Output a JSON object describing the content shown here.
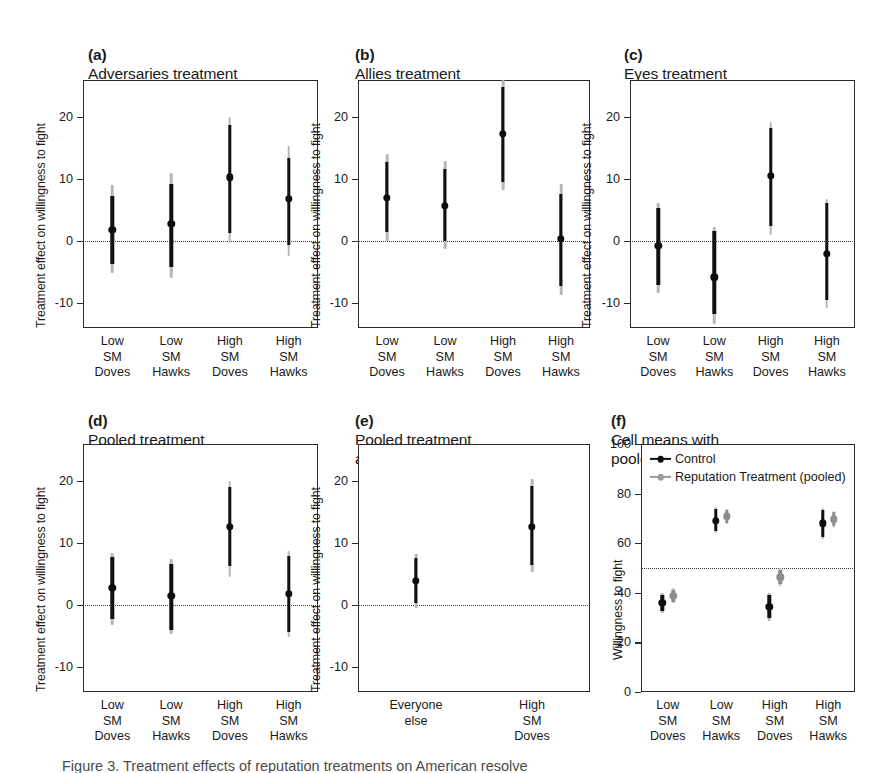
{
  "figure": {
    "y_axis_label_effect": "Treatment effect on willingness to fight",
    "y_axis_label_wtf": "Willingness to fight",
    "caption_partial": "Figure 3. Treatment effects of reputation treatments on American resolve"
  },
  "chart_data": [
    {
      "id": "panel-a",
      "type": "scatter",
      "panel_tag": "(a)",
      "title": "Adversaries treatment",
      "ylabel": "Treatment effect on willingness to fight",
      "xlabel": "",
      "ylim": [
        -14,
        26
      ],
      "yticks": [
        20,
        10,
        0,
        -10
      ],
      "ytick_labels": [
        "20",
        "10",
        "0",
        "-10"
      ],
      "grid": false,
      "reference_line": 0,
      "categories": [
        "Low SM\nDoves",
        "Low SM\nHawks",
        "High SM\nDoves",
        "High SM\nHawks"
      ],
      "series": [
        {
          "name": "Treatment effect",
          "color": "#111111",
          "values": [
            1.8,
            2.8,
            10.3,
            6.8
          ],
          "ci_inner_low": [
            -3.6,
            -4.1,
            1.3,
            -0.6
          ],
          "ci_inner_high": [
            7.3,
            9.2,
            18.8,
            13.5
          ],
          "ci_outer_low": [
            -5.2,
            -5.9,
            -0.3,
            -2.4
          ],
          "ci_outer_high": [
            9.0,
            11.0,
            20.0,
            15.3
          ]
        }
      ]
    },
    {
      "id": "panel-b",
      "type": "scatter",
      "panel_tag": "(b)",
      "title": "Allies treatment",
      "ylabel": "Treatment effect on willingness to fight",
      "xlabel": "",
      "ylim": [
        -14,
        26
      ],
      "yticks": [
        20,
        10,
        0,
        -10
      ],
      "ytick_labels": [
        "20",
        "10",
        "0",
        "-10"
      ],
      "grid": false,
      "reference_line": 0,
      "categories": [
        "Low SM\nDoves",
        "Low SM\nHawks",
        "High SM\nDoves",
        "High SM\nHawks"
      ],
      "series": [
        {
          "name": "Treatment effect",
          "color": "#111111",
          "values": [
            7.0,
            5.7,
            17.3,
            0.4
          ],
          "ci_inner_low": [
            1.5,
            0.0,
            9.5,
            -7.3
          ],
          "ci_inner_high": [
            12.8,
            11.6,
            24.8,
            7.6
          ],
          "ci_outer_low": [
            0.0,
            -1.3,
            8.2,
            -8.7
          ],
          "ci_outer_high": [
            14.0,
            13.0,
            26.0,
            9.2
          ]
        }
      ]
    },
    {
      "id": "panel-c",
      "type": "scatter",
      "panel_tag": "(c)",
      "title": "Eyes treatment",
      "ylabel": "Treatment effect on willingness to fight",
      "xlabel": "",
      "ylim": [
        -14,
        26
      ],
      "yticks": [
        20,
        10,
        0,
        -10
      ],
      "ytick_labels": [
        "20",
        "10",
        "0",
        "-10"
      ],
      "grid": false,
      "reference_line": 0,
      "categories": [
        "Low SM\nDoves",
        "Low SM\nHawks",
        "High SM\nDoves",
        "High SM\nHawks"
      ],
      "series": [
        {
          "name": "Treatment effect",
          "color": "#111111",
          "values": [
            -0.7,
            -5.8,
            10.5,
            -2.0
          ],
          "ci_inner_low": [
            -7.0,
            -11.8,
            2.4,
            -9.5
          ],
          "ci_inner_high": [
            5.3,
            1.6,
            18.2,
            6.2
          ],
          "ci_outer_low": [
            -8.3,
            -13.4,
            1.0,
            -10.8
          ],
          "ci_outer_high": [
            6.2,
            2.3,
            19.2,
            6.8
          ]
        }
      ]
    },
    {
      "id": "panel-d",
      "type": "scatter",
      "panel_tag": "(d)",
      "title": "Pooled treatment",
      "ylabel": "Treatment effect on willingness to fight",
      "xlabel": "",
      "ylim": [
        -14,
        26
      ],
      "yticks": [
        20,
        10,
        0,
        -10
      ],
      "ytick_labels": [
        "20",
        "10",
        "0",
        "-10"
      ],
      "grid": false,
      "reference_line": 0,
      "categories": [
        "Low SM\nDoves",
        "Low SM\nHawks",
        "High SM\nDoves",
        "High SM\nHawks"
      ],
      "series": [
        {
          "name": "Treatment effect",
          "color": "#111111",
          "values": [
            2.8,
            1.5,
            12.6,
            1.8
          ],
          "ci_inner_low": [
            -2.2,
            -4.0,
            6.3,
            -4.3
          ],
          "ci_inner_high": [
            7.7,
            6.6,
            19.0,
            8.0
          ],
          "ci_outer_low": [
            -3.2,
            -4.6,
            4.6,
            -5.2
          ],
          "ci_outer_high": [
            8.4,
            7.5,
            20.0,
            8.8
          ]
        }
      ]
    },
    {
      "id": "panel-e",
      "type": "scatter",
      "panel_tag": "(e)",
      "title": "Pooled treatment\nand pooled comparison",
      "ylabel": "Treatment effect on willingness to fight",
      "xlabel": "",
      "ylim": [
        -14,
        26
      ],
      "yticks": [
        20,
        10,
        0,
        -10
      ],
      "ytick_labels": [
        "20",
        "10",
        "0",
        "-10"
      ],
      "grid": false,
      "reference_line": 0,
      "categories": [
        "Everyone\nelse",
        "High SM\nDoves"
      ],
      "series": [
        {
          "name": "Treatment effect",
          "color": "#111111",
          "values": [
            3.9,
            12.6
          ],
          "ci_inner_low": [
            0.3,
            6.5
          ],
          "ci_inner_high": [
            7.6,
            19.3
          ],
          "ci_outer_low": [
            -0.5,
            5.3
          ],
          "ci_outer_high": [
            8.2,
            20.3
          ]
        }
      ]
    },
    {
      "id": "panel-f",
      "type": "scatter",
      "panel_tag": "(f)",
      "title": "Cell means with\npooled treatment",
      "ylabel": "Willingness to fight",
      "xlabel": "",
      "ylim": [
        0,
        100
      ],
      "yticks": [
        100,
        80,
        60,
        40,
        20,
        0
      ],
      "ytick_labels": [
        "100",
        "80",
        "60",
        "40",
        "20",
        "0"
      ],
      "grid": false,
      "reference_line": 50,
      "legend_position": "top-left",
      "categories": [
        "Low SM\nDoves",
        "Low SM\nHawks",
        "High SM\nDoves",
        "High SM\nHawks"
      ],
      "series": [
        {
          "name": "Control",
          "color": "#111111",
          "values": [
            36.0,
            69.0,
            34.3,
            68.0
          ],
          "ci_inner_low": [
            32.6,
            64.8,
            29.8,
            62.6
          ],
          "ci_inner_high": [
            39.3,
            73.8,
            39.0,
            73.3
          ],
          "ci_outer_low": [
            31.8,
            64.0,
            28.8,
            61.6
          ],
          "ci_outer_high": [
            40.0,
            74.6,
            40.0,
            74.2
          ]
        },
        {
          "name": "Reputation Treatment (pooled)",
          "color": "#8d8d8d",
          "values": [
            38.8,
            70.8,
            46.3,
            69.6
          ],
          "ci_inner_low": [
            36.4,
            68.2,
            43.6,
            66.8
          ],
          "ci_inner_high": [
            41.2,
            73.2,
            49.0,
            72.4
          ],
          "ci_outer_low": [
            35.8,
            67.6,
            42.8,
            66.2
          ],
          "ci_outer_high": [
            41.8,
            73.8,
            49.8,
            73.0
          ]
        }
      ],
      "legend": [
        {
          "label": "Control",
          "color": "#111111"
        },
        {
          "label": "Reputation Treatment (pooled)",
          "color": "#8d8d8d"
        }
      ]
    }
  ]
}
